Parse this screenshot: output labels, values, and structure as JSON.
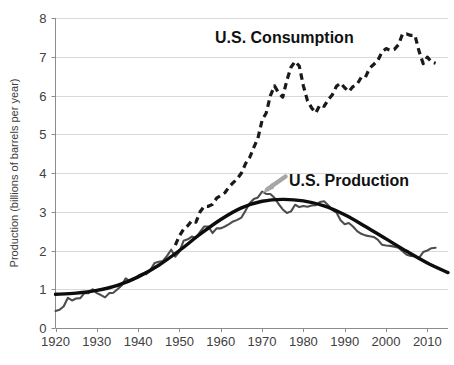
{
  "chart_data": {
    "type": "line",
    "title": "",
    "xlabel": "",
    "ylabel": "Production (billions of barrels per year)",
    "xlim": [
      1920,
      2015
    ],
    "ylim": [
      0,
      8
    ],
    "xticks": [
      1920,
      1930,
      1940,
      1950,
      1960,
      1970,
      1980,
      1990,
      2000,
      2010
    ],
    "yticks": [
      0,
      1,
      2,
      3,
      4,
      5,
      6,
      7,
      8
    ],
    "grid": "horizontal",
    "legend_position": "inline-annotations",
    "annotations": [
      {
        "name": "consumption-label",
        "text": "U.S. Consumption",
        "x": 1984,
        "y": 7.5
      },
      {
        "name": "production-label",
        "text": "U.S. Production",
        "x": 1996,
        "y": 3.85
      },
      {
        "name": "production-arrow",
        "text": "",
        "from_x": 1994,
        "from_y": 3.9,
        "to_x": 1987,
        "to_y": 3.5,
        "color": "#a6a6a6"
      }
    ],
    "series": [
      {
        "name": "U.S. Consumption",
        "style": "dashed",
        "color": "#1a1a1a",
        "x": [
          1949,
          1950,
          1951,
          1952,
          1953,
          1954,
          1955,
          1956,
          1957,
          1958,
          1959,
          1960,
          1961,
          1962,
          1963,
          1964,
          1965,
          1966,
          1967,
          1968,
          1969,
          1970,
          1971,
          1972,
          1973,
          1974,
          1975,
          1976,
          1977,
          1978,
          1979,
          1980,
          1981,
          1982,
          1983,
          1984,
          1985,
          1986,
          1987,
          1988,
          1989,
          1990,
          1991,
          1992,
          1993,
          1994,
          1995,
          1996,
          1997,
          1998,
          1999,
          2000,
          2001,
          2002,
          2003,
          2004,
          2005,
          2006,
          2007,
          2008,
          2009,
          2010,
          2011,
          2012
        ],
        "y": [
          2.14,
          2.38,
          2.55,
          2.64,
          2.77,
          2.73,
          3.0,
          3.14,
          3.14,
          3.19,
          3.35,
          3.42,
          3.49,
          3.64,
          3.75,
          3.85,
          4.0,
          4.24,
          4.4,
          4.66,
          4.9,
          5.36,
          5.55,
          5.99,
          6.25,
          6.07,
          5.96,
          6.39,
          6.73,
          6.88,
          6.76,
          6.25,
          5.86,
          5.68,
          5.55,
          5.76,
          5.72,
          5.89,
          6.02,
          6.24,
          6.32,
          6.2,
          6.1,
          6.23,
          6.29,
          6.47,
          6.47,
          6.7,
          6.8,
          6.9,
          7.12,
          7.21,
          7.17,
          7.19,
          7.31,
          7.59,
          7.59,
          7.55,
          7.55,
          7.14,
          6.82,
          6.99,
          6.87,
          6.83
        ]
      },
      {
        "name": "U.S. Production (actual)",
        "style": "solid-thin",
        "color": "#4d4d4d",
        "x": [
          1920,
          1921,
          1922,
          1923,
          1924,
          1925,
          1926,
          1927,
          1928,
          1929,
          1930,
          1931,
          1932,
          1933,
          1934,
          1935,
          1936,
          1937,
          1938,
          1939,
          1940,
          1941,
          1942,
          1943,
          1944,
          1945,
          1946,
          1947,
          1948,
          1949,
          1950,
          1951,
          1952,
          1953,
          1954,
          1955,
          1956,
          1957,
          1958,
          1959,
          1960,
          1961,
          1962,
          1963,
          1964,
          1965,
          1966,
          1967,
          1968,
          1969,
          1970,
          1971,
          1972,
          1973,
          1974,
          1975,
          1976,
          1977,
          1978,
          1979,
          1980,
          1981,
          1982,
          1983,
          1984,
          1985,
          1986,
          1987,
          1988,
          1989,
          1990,
          1991,
          1992,
          1993,
          1994,
          1995,
          1996,
          1997,
          1998,
          1999,
          2000,
          2001,
          2002,
          2003,
          2004,
          2005,
          2006,
          2007,
          2008,
          2009,
          2010,
          2011,
          2012
        ],
        "y": [
          0.44,
          0.47,
          0.56,
          0.78,
          0.71,
          0.76,
          0.77,
          0.9,
          0.9,
          1.0,
          0.9,
          0.85,
          0.79,
          0.9,
          0.91,
          1.0,
          1.1,
          1.28,
          1.21,
          1.26,
          1.35,
          1.4,
          1.39,
          1.5,
          1.68,
          1.71,
          1.73,
          1.86,
          2.02,
          1.84,
          1.97,
          2.25,
          2.29,
          2.36,
          2.32,
          2.48,
          2.62,
          2.62,
          2.45,
          2.57,
          2.57,
          2.62,
          2.68,
          2.75,
          2.79,
          2.85,
          3.03,
          3.22,
          3.33,
          3.37,
          3.52,
          3.46,
          3.46,
          3.36,
          3.2,
          3.06,
          2.97,
          3.01,
          3.18,
          3.12,
          3.15,
          3.13,
          3.16,
          3.17,
          3.25,
          3.27,
          3.17,
          3.05,
          2.98,
          2.78,
          2.68,
          2.71,
          2.62,
          2.5,
          2.43,
          2.39,
          2.37,
          2.35,
          2.28,
          2.15,
          2.13,
          2.12,
          2.1,
          2.07,
          1.98,
          1.89,
          1.86,
          1.85,
          1.81,
          1.96,
          2.0,
          2.06,
          2.07
        ]
      },
      {
        "name": "U.S. Production (Hubbert fit)",
        "style": "solid-thick",
        "color": "#0d0d0d",
        "x": [
          1920,
          1925,
          1930,
          1935,
          1940,
          1945,
          1950,
          1955,
          1960,
          1965,
          1970,
          1975,
          1980,
          1985,
          1990,
          1995,
          2000,
          2005,
          2010,
          2015
        ],
        "y": [
          0.87,
          0.9,
          0.97,
          1.1,
          1.32,
          1.62,
          2.0,
          2.42,
          2.8,
          3.1,
          3.27,
          3.32,
          3.28,
          3.15,
          2.92,
          2.62,
          2.3,
          1.98,
          1.68,
          1.43
        ]
      }
    ]
  },
  "axis": {
    "y_title": "Production (billions of barrels per year)",
    "y_labels": [
      "8",
      "7",
      "6",
      "5",
      "4",
      "3",
      "2",
      "1",
      "0"
    ],
    "x_labels": [
      "1920",
      "1930",
      "1940",
      "1950",
      "1960",
      "1970",
      "1980",
      "1990",
      "2000",
      "2010"
    ]
  },
  "labels": {
    "consumption": "U.S. Consumption",
    "production": "U.S. Production"
  },
  "colors": {
    "consumption_line": "#1a1a1a",
    "production_actual": "#4d4d4d",
    "production_fit": "#0d0d0d",
    "arrow": "#a6a6a6",
    "gridline": "#d9d9d9",
    "axis": "#8c8c8c",
    "tick_text": "#404040"
  },
  "caption": {
    "partial_text": ""
  }
}
